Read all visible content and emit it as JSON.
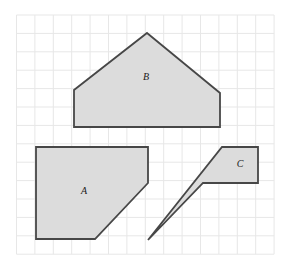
{
  "figure": {
    "canvas": {
      "width": 292,
      "height": 273,
      "background": "#ffffff"
    },
    "grid": {
      "name": "square-grid",
      "x_start": 16.5,
      "y_start": 15.0,
      "cell_size": 18.4,
      "columns": 14,
      "rows": 13,
      "line_color": "#e7e7e7",
      "line_width": 1,
      "visible": true
    },
    "style": {
      "shape_fill": "#dcdcdc",
      "shape_stroke": "#474747",
      "shape_stroke_width": 1.8,
      "label_color": "#1a1a1a",
      "label_font_size": 10
    },
    "shapes": [
      {
        "id": "shape-a",
        "label": "A",
        "label_x": 84,
        "label_y": 192,
        "description": "pentagon: square with bottom-right corner cut off",
        "points": "36,147 148,147 148,183 95,239 36,239",
        "vertices": [
          [
            36,
            147
          ],
          [
            148,
            147
          ],
          [
            148,
            183
          ],
          [
            95,
            239
          ],
          [
            36,
            239
          ]
        ]
      },
      {
        "id": "shape-b",
        "label": "B",
        "label_x": 146,
        "label_y": 78,
        "description": "pentagon shaped like a house with a peaked roof",
        "points": "147,33 220,93 220,127 74,127 74,90",
        "vertices": [
          [
            147,
            33
          ],
          [
            220,
            93
          ],
          [
            220,
            127
          ],
          [
            74,
            127
          ],
          [
            74,
            90
          ]
        ]
      },
      {
        "id": "shape-c",
        "label": "C",
        "label_x": 240,
        "label_y": 165,
        "description": "pentagon: rectangle with a long narrow spike to the lower left",
        "points": "222,147 258,147 258,183 203,183 148,240",
        "vertices": [
          [
            222,
            147
          ],
          [
            258,
            147
          ],
          [
            258,
            183
          ],
          [
            203,
            183
          ],
          [
            148,
            240
          ]
        ]
      }
    ]
  }
}
